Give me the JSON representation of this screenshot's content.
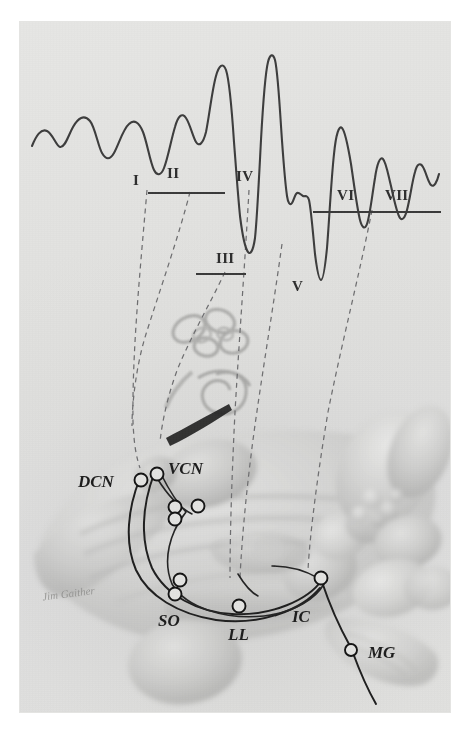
{
  "figure": {
    "medium": "scanned pencil illustration",
    "background_color": "#e2e2e0",
    "ink_color": "#2e2e2e",
    "dash_color": "#6e6e70"
  },
  "waveform": {
    "name": "abr-waveform",
    "stroke_color": "#3d3d3d",
    "peak_labels": [
      {
        "id": "I",
        "label": "I",
        "x": 133,
        "y": 159
      },
      {
        "id": "II",
        "label": "II",
        "x": 167,
        "y": 152
      },
      {
        "id": "III",
        "label": "III",
        "x": 216,
        "y": 237
      },
      {
        "id": "IV",
        "label": "IV",
        "x": 236,
        "y": 155
      },
      {
        "id": "V",
        "label": "V",
        "x": 292,
        "y": 265
      },
      {
        "id": "VI",
        "label": "VI",
        "x": 337,
        "y": 174
      },
      {
        "id": "VII",
        "label": "VII",
        "x": 385,
        "y": 174
      }
    ],
    "brackets": [
      {
        "id": "bracket-II-IV",
        "x1": 148,
        "x2": 223,
        "y": 167
      },
      {
        "id": "bracket-III",
        "x1": 195,
        "x2": 244,
        "y": 248
      },
      {
        "id": "bracket-VI-VII",
        "x1": 313,
        "x2": 440,
        "y": 186
      }
    ]
  },
  "anatomy": {
    "name": "brainstem-auditory-pathway",
    "labels": [
      {
        "id": "DCN",
        "label": "DCN",
        "x": 80,
        "y": 468,
        "description": "dorsal cochlear nucleus"
      },
      {
        "id": "VCN",
        "label": "VCN",
        "x": 148,
        "y": 458,
        "description": "ventral cochlear nucleus"
      },
      {
        "id": "SO",
        "label": "SO",
        "x": 162,
        "y": 598,
        "description": "superior olivary complex"
      },
      {
        "id": "LL",
        "label": "LL",
        "x": 231,
        "y": 612,
        "description": "lateral lemniscus"
      },
      {
        "id": "IC",
        "label": "IC",
        "x": 290,
        "y": 597,
        "description": "inferior colliculus"
      },
      {
        "id": "MG",
        "label": "MG",
        "x": 346,
        "y": 627,
        "description": "medial geniculate body"
      }
    ],
    "signature": "Jim Gaither"
  },
  "projection_lines": {
    "name": "dashed-projection-lines",
    "count": 6,
    "color": "#6e6e70",
    "description": "dashed lines linking ABR waveform peaks I-VII to anatomical generators"
  }
}
